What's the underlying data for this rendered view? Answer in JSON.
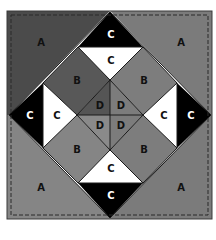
{
  "diagram": {
    "canvas": {
      "width": 216,
      "height": 225
    },
    "colors": {
      "background": "#ffffff",
      "outline": "#1a1a1a",
      "dashed_border": "#2a2a2a",
      "a_dark": "#4b4b4b",
      "a_medium": "#7b7b7b",
      "a_light": "#858585",
      "b_dark": "#585858",
      "b_medium": "#7d7d7d",
      "b_light": "#858585",
      "c_black": "#000000",
      "c_white": "#ffffff",
      "d_dark": "#555555",
      "d_medium": "#7c7c7c",
      "d_light": "#8a8a8a"
    },
    "pieces": [
      {
        "id": "A-top-left",
        "label": "A",
        "points": "7,11 110,11 9,115 7,115",
        "fill": "a_dark"
      },
      {
        "id": "A-top-right",
        "label": "A",
        "points": "110,11 212,11 212,115 211,115",
        "fill": "a_medium"
      },
      {
        "id": "A-bottom-left",
        "label": "A",
        "points": "7,115 9,115 110,218 110,219 7,219",
        "fill": "a_light"
      },
      {
        "id": "A-bottom-right",
        "label": "A",
        "points": "211,115 212,115 212,219 110,219 110,218",
        "fill": "a_medium"
      },
      {
        "id": "C-outer-top",
        "label": "C",
        "points": "110,12 143,47 78,47",
        "fill": "c_black"
      },
      {
        "id": "C-outer-left",
        "label": "C",
        "points": "9,115 43,83 43,148",
        "fill": "c_black"
      },
      {
        "id": "C-outer-right",
        "label": "C",
        "points": "211,115 177,83 177,148",
        "fill": "c_black"
      },
      {
        "id": "C-outer-bottom",
        "label": "C",
        "points": "110,218 78,183 143,183",
        "fill": "c_black"
      },
      {
        "id": "C-inner-top",
        "label": "C",
        "points": "78,47 143,47 110,80",
        "fill": "c_white"
      },
      {
        "id": "C-inner-left",
        "label": "C",
        "points": "43,83 77,115 43,148",
        "fill": "c_white"
      },
      {
        "id": "C-inner-right",
        "label": "C",
        "points": "177,83 177,148 143,115",
        "fill": "c_white"
      },
      {
        "id": "C-inner-bottom",
        "label": "C",
        "points": "78,183 110,150 143,183",
        "fill": "c_white"
      },
      {
        "id": "B-top-left",
        "label": "B",
        "points": "78,47 110,80 77,115 43,83",
        "fill": "b_dark"
      },
      {
        "id": "B-top-right",
        "label": "B",
        "points": "143,47 177,83 143,115 110,80",
        "fill": "b_medium"
      },
      {
        "id": "B-bottom-left",
        "label": "B",
        "points": "43,148 77,115 110,150 78,183",
        "fill": "b_light"
      },
      {
        "id": "B-bottom-right",
        "label": "B",
        "points": "143,115 177,148 143,183 110,150",
        "fill": "b_medium"
      },
      {
        "id": "D-top-left",
        "label": "D",
        "points": "110,80 110,115 77,115",
        "fill": "d_dark"
      },
      {
        "id": "D-top-right",
        "label": "D",
        "points": "110,80 143,115 110,115",
        "fill": "d_medium"
      },
      {
        "id": "D-bottom-left",
        "label": "D",
        "points": "77,115 110,115 110,150",
        "fill": "d_light"
      },
      {
        "id": "D-bottom-right",
        "label": "D",
        "points": "110,115 143,115 110,150",
        "fill": "d_medium"
      }
    ],
    "labels": [
      {
        "id": "label-A-top-left",
        "text": "A",
        "x": 41,
        "y": 43,
        "tone": "dark"
      },
      {
        "id": "label-A-top-right",
        "text": "A",
        "x": 181,
        "y": 43,
        "tone": "dark"
      },
      {
        "id": "label-A-bottom-left",
        "text": "A",
        "x": 41,
        "y": 188,
        "tone": "dark"
      },
      {
        "id": "label-A-bottom-right",
        "text": "A",
        "x": 181,
        "y": 188,
        "tone": "dark"
      },
      {
        "id": "label-C-outer-top",
        "text": "C",
        "x": 111,
        "y": 35,
        "tone": "light"
      },
      {
        "id": "label-C-outer-left",
        "text": "C",
        "x": 30,
        "y": 116,
        "tone": "light"
      },
      {
        "id": "label-C-outer-right",
        "text": "C",
        "x": 191,
        "y": 116,
        "tone": "light"
      },
      {
        "id": "label-C-outer-bottom",
        "text": "C",
        "x": 111,
        "y": 196,
        "tone": "light"
      },
      {
        "id": "label-C-inner-top",
        "text": "C",
        "x": 111,
        "y": 61,
        "tone": "dark"
      },
      {
        "id": "label-C-inner-left",
        "text": "C",
        "x": 57,
        "y": 116,
        "tone": "dark"
      },
      {
        "id": "label-C-inner-right",
        "text": "C",
        "x": 164,
        "y": 116,
        "tone": "dark"
      },
      {
        "id": "label-C-inner-bottom",
        "text": "C",
        "x": 111,
        "y": 169,
        "tone": "dark"
      },
      {
        "id": "label-B-top-left",
        "text": "B",
        "x": 77,
        "y": 81,
        "tone": "dark"
      },
      {
        "id": "label-B-top-right",
        "text": "B",
        "x": 144,
        "y": 81,
        "tone": "dark"
      },
      {
        "id": "label-B-bottom-left",
        "text": "B",
        "x": 77,
        "y": 150,
        "tone": "dark"
      },
      {
        "id": "label-B-bottom-right",
        "text": "B",
        "x": 144,
        "y": 150,
        "tone": "dark"
      },
      {
        "id": "label-D-top-left",
        "text": "D",
        "x": 100,
        "y": 106,
        "tone": "dark"
      },
      {
        "id": "label-D-top-right",
        "text": "D",
        "x": 121,
        "y": 106,
        "tone": "dark"
      },
      {
        "id": "label-D-bottom-left",
        "text": "D",
        "x": 100,
        "y": 126,
        "tone": "dark"
      },
      {
        "id": "label-D-bottom-right",
        "text": "D",
        "x": 121,
        "y": 126,
        "tone": "dark"
      }
    ],
    "outline_lines": [
      {
        "points": "110,12 211,115 110,218 9,115 110,12"
      },
      {
        "points": "78,47 143,47 177,83 177,148 143,183 78,183 43,148 43,83 78,47"
      },
      {
        "points": "110,80 143,115 110,150 77,115 110,80"
      },
      {
        "points": "78,47 110,80"
      },
      {
        "points": "143,47 110,80"
      },
      {
        "points": "43,83 77,115"
      },
      {
        "points": "43,148 77,115"
      },
      {
        "points": "177,83 143,115"
      },
      {
        "points": "177,148 143,115"
      },
      {
        "points": "78,183 110,150"
      },
      {
        "points": "143,183 110,150"
      },
      {
        "points": "110,80 110,150"
      },
      {
        "points": "77,115 143,115"
      }
    ],
    "border": {
      "x": 7,
      "y": 11,
      "width": 205,
      "height": 208,
      "inset_dash": {
        "x": 11,
        "y": 15,
        "width": 197,
        "height": 200
      }
    }
  }
}
